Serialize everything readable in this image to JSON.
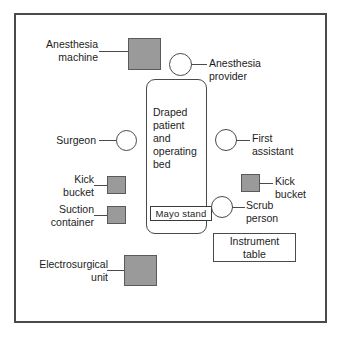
{
  "diagram": {
    "colors": {
      "equipment_fill": "#9a9a9a",
      "outline": "#4a4a4a",
      "background": "#ffffff",
      "text": "#1c1c1c"
    },
    "bed": {
      "label": "Draped\npatient\nand\noperating\nbed",
      "mayo_stand_label": "Mayo  stand"
    },
    "equipment": {
      "anesthesia_machine": "Anesthesia\nmachine",
      "kick_bucket_left": "Kick\nbucket",
      "suction_container": "Suction\ncontainer",
      "electrosurgical_unit": "Electrosurgical\nunit",
      "kick_bucket_right": "Kick\nbucket",
      "instrument_table": "Instrument\ntable"
    },
    "personnel": {
      "anesthesia_provider": "Anesthesia\nprovider",
      "surgeon": "Surgeon",
      "first_assistant": "First\nassistant",
      "scrub_person": "Scrub\nperson"
    }
  }
}
